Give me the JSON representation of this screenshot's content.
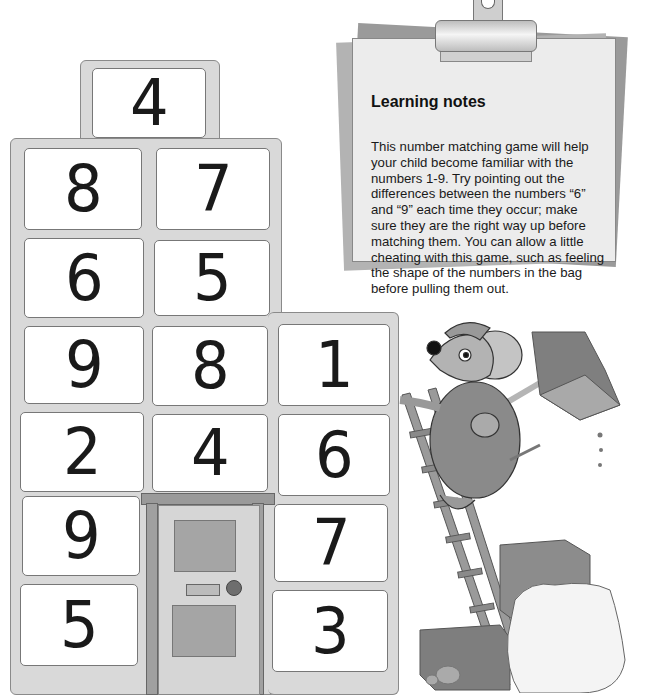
{
  "learning_notes": {
    "title": "Learning notes",
    "body": "This number matching game will help your child become familiar with the numbers 1-9. Try pointing out the differences between the numbers “6” and “9” each time they occur; make sure they are the right way up before matching them. You can allow a little cheating with this game, such as feeling the shape of the numbers in the bag before pulling them out."
  },
  "house": {
    "tiles": [
      {
        "row": 0,
        "col": 1,
        "value": "4"
      },
      {
        "row": 1,
        "col": 0,
        "value": "8"
      },
      {
        "row": 1,
        "col": 1,
        "value": "7"
      },
      {
        "row": 2,
        "col": 0,
        "value": "6"
      },
      {
        "row": 2,
        "col": 1,
        "value": "5"
      },
      {
        "row": 3,
        "col": 0,
        "value": "9"
      },
      {
        "row": 3,
        "col": 1,
        "value": "8"
      },
      {
        "row": 3,
        "col": 2,
        "value": "1"
      },
      {
        "row": 4,
        "col": 0,
        "value": "2"
      },
      {
        "row": 4,
        "col": 1,
        "value": "4"
      },
      {
        "row": 4,
        "col": 2,
        "value": "6"
      },
      {
        "row": 5,
        "col": 0,
        "value": "9"
      },
      {
        "row": 5,
        "col": 2,
        "value": "7"
      },
      {
        "row": 6,
        "col": 0,
        "value": "5"
      },
      {
        "row": 6,
        "col": 2,
        "value": "3"
      }
    ]
  },
  "illustration": {
    "characters": [
      "mouse-with-cap",
      "ladder",
      "shovel",
      "bricks",
      "sack"
    ]
  }
}
